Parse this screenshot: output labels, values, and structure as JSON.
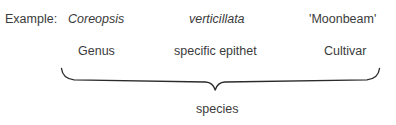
{
  "figure": {
    "caption_prefix": "Example:",
    "text_color": "#3b3b3b",
    "brace_color": "#2b2b2b",
    "background": "#ffffff"
  },
  "name_parts": [
    {
      "example": "Coreopsis",
      "term": "Genus",
      "style": "italic"
    },
    {
      "example": "verticillata",
      "term": "specific epithet",
      "style": "italic"
    },
    {
      "example": "'Moonbeam'",
      "term": "Cultivar",
      "style": "normal"
    }
  ],
  "grouping": {
    "label": "species",
    "brace_orientation": "down"
  }
}
